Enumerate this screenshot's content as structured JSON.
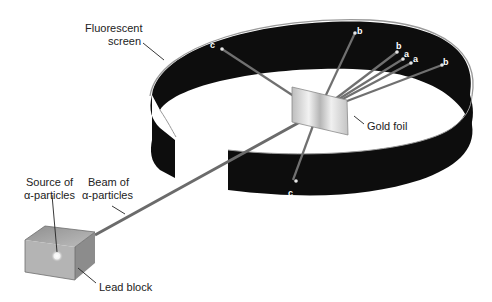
{
  "labels": {
    "fluorescent_screen": [
      "Fluorescent",
      "screen"
    ],
    "gold_foil": "Gold foil",
    "source": [
      "Source of",
      "α-particles"
    ],
    "beam": [
      "Beam of",
      "α-particles"
    ],
    "lead_block": "Lead block"
  },
  "deflection_marks": {
    "c_top": "c",
    "b1": "b",
    "b2": "b",
    "a1": "a",
    "a2": "a",
    "b3": "b",
    "c_bottom": "c"
  },
  "colors": {
    "screen": "#0d0d0d",
    "screen_rim": "#9a9a9a",
    "beam": "#6b6b6b",
    "foil": "#d8d8d8",
    "block": "#a9a9a9",
    "background": "#ffffff"
  }
}
